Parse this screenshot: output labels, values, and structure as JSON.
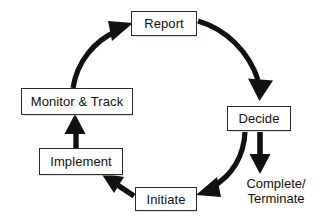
{
  "diagram": {
    "type": "cycle-flow-diagram",
    "colors": {
      "background": "#ffffff",
      "box_border": "#2b2b2b",
      "box_fill": "#ffffff",
      "arrow": "#111111",
      "text": "#111111"
    },
    "nodes": [
      {
        "id": "report",
        "label": "Report",
        "shape": "rectangle"
      },
      {
        "id": "decide",
        "label": "Decide",
        "shape": "rectangle"
      },
      {
        "id": "initiate",
        "label": "Initiate",
        "shape": "rectangle"
      },
      {
        "id": "implement",
        "label": "Implement",
        "shape": "rectangle"
      },
      {
        "id": "monitor",
        "label": "Monitor & Track",
        "shape": "rectangle"
      }
    ],
    "terminal_label": {
      "id": "complete-terminate",
      "line1": "Complete/",
      "line2": "Terminate"
    },
    "edges": [
      {
        "from": "report",
        "to": "decide",
        "style": "curved-arrow"
      },
      {
        "from": "decide",
        "to": "complete-terminate",
        "style": "straight-arrow"
      },
      {
        "from": "decide",
        "to": "initiate",
        "style": "curved-arrow"
      },
      {
        "from": "initiate",
        "to": "implement",
        "style": "straight-arrow"
      },
      {
        "from": "implement",
        "to": "monitor",
        "style": "straight-arrow"
      },
      {
        "from": "monitor",
        "to": "report",
        "style": "curved-arrow"
      }
    ]
  }
}
